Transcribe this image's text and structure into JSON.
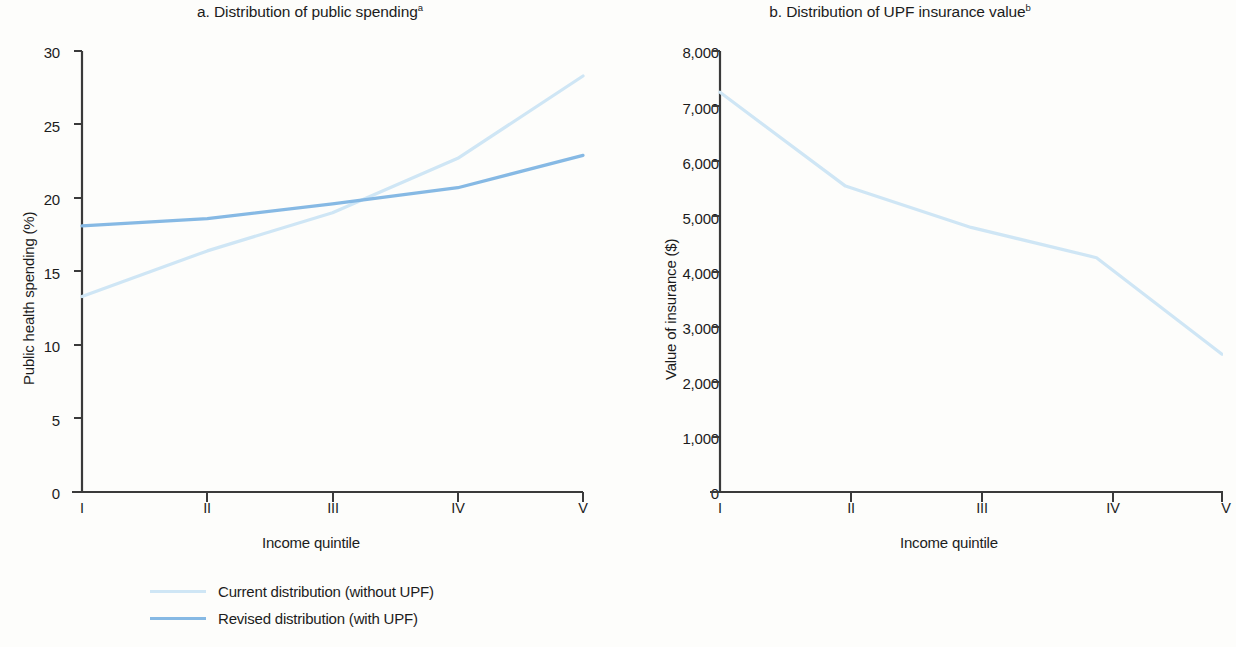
{
  "figure": {
    "background": "#fdfdfb",
    "colors": {
      "current": "#cfe6f5",
      "revised": "#86b9e4",
      "axis": "#3a3a3a",
      "text": "#1c1c1c"
    }
  },
  "panel_a": {
    "title_main": "a. Distribution of public spending",
    "title_sup": "a",
    "ylabel": "Public health spending (%)",
    "xlabel": "Income quintile",
    "yticks": [
      "0",
      "5",
      "10",
      "15",
      "20",
      "25",
      "30"
    ],
    "xticks": [
      "I",
      "II",
      "III",
      "IV",
      "V"
    ]
  },
  "panel_b": {
    "title_main": "b. Distribution of UPF insurance value",
    "title_sup": "b",
    "ylabel": "Value of insurance ($)",
    "xlabel": "Income quintile",
    "yticks": [
      "0",
      "1,000",
      "2,000",
      "3,000",
      "4,000",
      "5,000",
      "6,000",
      "7,000",
      "8,000"
    ],
    "xticks": [
      "I",
      "II",
      "III",
      "IV",
      "V"
    ]
  },
  "legend": {
    "items": [
      {
        "label": "Current distribution (without UPF)",
        "color": "#cfe6f5"
      },
      {
        "label": "Revised distribution (with UPF)",
        "color": "#86b9e4"
      }
    ]
  },
  "chart_data": [
    {
      "type": "line",
      "panel": "a",
      "title": "a. Distribution of public spending",
      "xlabel": "Income quintile",
      "ylabel": "Public health spending (%)",
      "categories": [
        "I",
        "II",
        "III",
        "IV",
        "V"
      ],
      "ylim": [
        0,
        30
      ],
      "yticks": [
        0,
        5,
        10,
        15,
        20,
        25,
        30
      ],
      "grid": false,
      "legend_position": "below",
      "series": [
        {
          "name": "Current distribution (without UPF)",
          "color": "#cfe6f5",
          "values": [
            13.3,
            16.4,
            19.0,
            22.7,
            28.3
          ]
        },
        {
          "name": "Revised distribution (with UPF)",
          "color": "#86b9e4",
          "values": [
            18.1,
            18.6,
            19.6,
            20.7,
            22.9
          ]
        }
      ]
    },
    {
      "type": "line",
      "panel": "b",
      "title": "b. Distribution of UPF insurance value",
      "xlabel": "Income quintile",
      "ylabel": "Value of insurance ($)",
      "categories": [
        "I",
        "II",
        "III",
        "IV",
        "V"
      ],
      "ylim": [
        0,
        8000
      ],
      "yticks": [
        0,
        1000,
        2000,
        3000,
        4000,
        5000,
        6000,
        7000,
        8000
      ],
      "grid": false,
      "legend_position": "none",
      "series": [
        {
          "name": "UPF insurance value",
          "color": "#cfe6f5",
          "values": [
            7250,
            5550,
            4800,
            4250,
            2500
          ]
        }
      ]
    }
  ]
}
